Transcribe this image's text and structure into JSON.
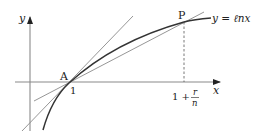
{
  "figure": {
    "axes": {
      "x_label": "x",
      "y_label": "y"
    },
    "curve": {
      "label": "y = ℓnx"
    },
    "points": {
      "A": {
        "label": "A",
        "tick_label": "1"
      },
      "P": {
        "label": "P"
      }
    },
    "x_tick": {
      "prefix": "1 +",
      "numerator": "r",
      "denominator": "n"
    },
    "colors": {
      "curve": "#333333",
      "lines": "#8a8a8a",
      "axes": "#8a8a8a",
      "text": "#222222"
    }
  }
}
